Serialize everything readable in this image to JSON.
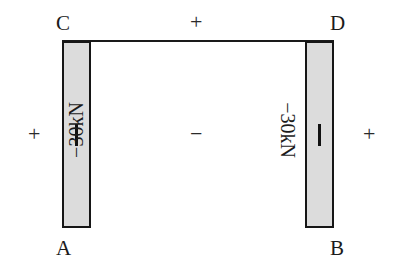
{
  "chart_data": {
    "type": "diagram",
    "subtype": "axial-force-diagram",
    "structure": "portal frame",
    "nodes": [
      {
        "id": "C",
        "label": "C",
        "position": "top-left"
      },
      {
        "id": "D",
        "label": "D",
        "position": "top-right"
      },
      {
        "id": "A",
        "label": "A",
        "position": "bottom-left"
      },
      {
        "id": "B",
        "label": "B",
        "position": "bottom-right"
      }
    ],
    "members": [
      {
        "name": "left-column",
        "from": "A",
        "to": "C",
        "value": -30,
        "unit": "kN",
        "label": "−30kN",
        "sign": "negative",
        "diagram_shown": true
      },
      {
        "name": "right-column",
        "from": "B",
        "to": "D",
        "value": -30,
        "unit": "kN",
        "label": "−30kN",
        "sign": "negative",
        "diagram_shown": true
      },
      {
        "name": "top-beam",
        "from": "C",
        "to": "D",
        "value": 0,
        "unit": "kN",
        "label": "",
        "sign": "zero",
        "diagram_shown": false
      }
    ],
    "sign_markers": [
      {
        "name": "top",
        "symbol": "+"
      },
      {
        "name": "left",
        "symbol": "+"
      },
      {
        "name": "right",
        "symbol": "+"
      },
      {
        "name": "middle",
        "symbol": "−"
      }
    ],
    "member_ticks": [
      {
        "name": "left-column-tick",
        "symbol": "│"
      },
      {
        "name": "right-column-tick",
        "symbol": "│"
      }
    ],
    "colors": {
      "fill": "#dcdcdc",
      "stroke": "#161616",
      "text": "#1b1b1b",
      "background": "#ffffff"
    }
  },
  "labels": {
    "node_c": "C",
    "node_d": "D",
    "node_a": "A",
    "node_b": "B",
    "value_left": "−30kN",
    "value_right": "−30kN",
    "sign_top": "+",
    "sign_left": "+",
    "sign_right": "+",
    "sign_middle": "−"
  }
}
